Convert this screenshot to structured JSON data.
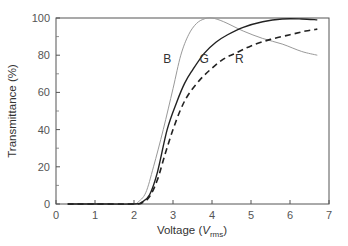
{
  "chart_data": {
    "type": "line",
    "title": "",
    "xlabel": "Voltage (V_rms)",
    "xlabel_main": "Voltage (",
    "xlabel_italic": "V",
    "xlabel_sub": "rms",
    "xlabel_close": ")",
    "ylabel": "Transmittance (%)",
    "xlim": [
      0,
      7
    ],
    "ylim": [
      0,
      100
    ],
    "xticks": [
      0,
      1,
      2,
      3,
      4,
      5,
      6,
      7
    ],
    "yticks": [
      0,
      20,
      40,
      60,
      80,
      100
    ],
    "grid": false,
    "legend": "inline labels",
    "series": [
      {
        "name": "B",
        "style": "thin gray solid",
        "color": "#999999",
        "x": [
          0.3,
          1.0,
          2.0,
          2.1,
          2.3,
          2.5,
          2.75,
          3.0,
          3.2,
          3.4,
          3.6,
          3.8,
          4.0,
          4.3,
          4.8,
          5.3,
          5.8,
          6.3,
          6.7
        ],
        "y": [
          0,
          0,
          0,
          1,
          6,
          20,
          40,
          62,
          80,
          91,
          97,
          99.5,
          100,
          98,
          93,
          89,
          86,
          82,
          80
        ]
      },
      {
        "name": "G",
        "style": "solid black",
        "color": "#222222",
        "x": [
          0.3,
          1.0,
          2.0,
          2.2,
          2.4,
          2.6,
          2.85,
          3.1,
          3.3,
          3.5,
          3.8,
          4.1,
          4.4,
          4.8,
          5.3,
          5.8,
          6.3,
          6.7
        ],
        "y": [
          0,
          0,
          0,
          1,
          5,
          17,
          40,
          55,
          65,
          72,
          81,
          87,
          91,
          95,
          98,
          99.5,
          99.5,
          99
        ]
      },
      {
        "name": "R",
        "style": "dashed black",
        "color": "#222222",
        "x": [
          0.3,
          1.0,
          2.0,
          2.2,
          2.4,
          2.6,
          2.8,
          3.0,
          3.2,
          3.4,
          3.7,
          4.0,
          4.3,
          4.6,
          5.0,
          5.5,
          6.0,
          6.4,
          6.7
        ],
        "y": [
          0,
          0,
          0,
          0.5,
          4,
          13,
          27,
          40,
          51,
          59,
          67,
          73,
          78,
          81,
          85,
          88.5,
          91,
          93,
          94
        ]
      }
    ],
    "annotations": [
      {
        "text": "B",
        "x": 2.85,
        "y": 78
      },
      {
        "text": "G",
        "x": 3.8,
        "y": 78
      },
      {
        "text": "R",
        "x": 4.7,
        "y": 78
      }
    ]
  }
}
